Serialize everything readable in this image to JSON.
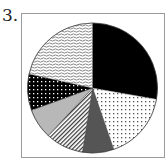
{
  "question": {
    "number_label": "3."
  },
  "chart_data": {
    "type": "pie",
    "title": "",
    "start_angle_deg": 0,
    "direction": "clockwise",
    "legend": [],
    "slices": [
      {
        "pattern": "solid-black",
        "start_deg": 0,
        "end_deg": 100,
        "percent": 27.8
      },
      {
        "pattern": "white-dotted",
        "start_deg": 100,
        "end_deg": 161,
        "percent": 16.9
      },
      {
        "pattern": "solid-dark-gray",
        "start_deg": 161,
        "end_deg": 189,
        "percent": 7.8
      },
      {
        "pattern": "diagonal-hatch",
        "start_deg": 189,
        "end_deg": 223,
        "percent": 9.4
      },
      {
        "pattern": "solid-light-gray",
        "start_deg": 223,
        "end_deg": 250,
        "percent": 7.5
      },
      {
        "pattern": "black-dotted",
        "start_deg": 250,
        "end_deg": 282.5,
        "percent": 9.0
      },
      {
        "pattern": "wavy-lines",
        "start_deg": 282.5,
        "end_deg": 360,
        "percent": 21.5
      }
    ],
    "geometry": {
      "cx": 92.5,
      "cy": 88,
      "r": 65
    }
  },
  "colors": {
    "black": "#000000",
    "dark_gray": "#555555",
    "light_gray": "#b8b8b8",
    "frame": "#9a9a9a"
  }
}
